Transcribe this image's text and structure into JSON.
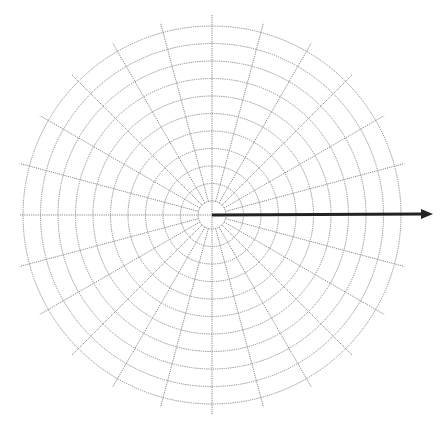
{
  "diagram": {
    "type": "polar-grid",
    "center": [
      212,
      215
    ],
    "inner_radius": 14,
    "ring_count": 10,
    "ring_spacing": 19,
    "outer_radius": 189,
    "spoke_count": 24,
    "spoke_step_deg": 15,
    "spoke_extent": 199,
    "axis_extent": 192,
    "grid_color": "#8a8a8a",
    "arrow": {
      "from": [
        212,
        215
      ],
      "to": [
        433,
        214
      ],
      "color": "#222222",
      "width": 3
    }
  }
}
